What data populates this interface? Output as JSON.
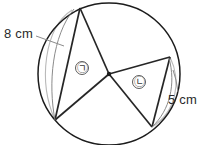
{
  "figure": {
    "kind": "circle-with-sectors",
    "title": "Circle divided by five radii with two labeled arcs",
    "circle": {
      "center_x": 109,
      "center_y": 74,
      "radius": 71,
      "stroke_color": "#1c1c1c"
    },
    "colors": {
      "outline": "#1c1c1c",
      "chord": "#262626",
      "faint_arc": "#b9b9b9",
      "leader": "#8c8c8c",
      "label_text": "#2a2a2a",
      "glyph_text": "#3a3a3a",
      "background": "#ffffff"
    },
    "center_point": {
      "label": "center",
      "x": 109,
      "y": 74
    },
    "vertices": [
      {
        "name": "top",
        "x": 80,
        "y": 8
      },
      {
        "name": "upper-left-chord-end",
        "x": 72,
        "y": 10
      },
      {
        "name": "bottom-left",
        "x": 55,
        "y": 120
      },
      {
        "name": "bottom-right",
        "x": 152,
        "y": 127
      },
      {
        "name": "right",
        "x": 170,
        "y": 57
      }
    ],
    "radii": [
      {
        "from": "center",
        "to": "top"
      },
      {
        "from": "center",
        "to": "bottom-left"
      },
      {
        "from": "center",
        "to": "bottom-right"
      },
      {
        "from": "center",
        "to": "right"
      }
    ],
    "chords": [
      {
        "name": "left-chord",
        "from": "top",
        "to": "bottom-left"
      },
      {
        "name": "right-chord",
        "from": "right",
        "to": "bottom-right"
      }
    ],
    "arc_labels": [
      {
        "id": "arc-left",
        "value": "8 cm",
        "number": 8,
        "unit": "cm",
        "side": "left",
        "text_x": 4,
        "text_y": 38
      },
      {
        "id": "arc-right",
        "value": "5 cm",
        "number": 5,
        "unit": "cm",
        "side": "right",
        "text_x": 168,
        "text_y": 104
      }
    ],
    "region_labels": [
      {
        "id": "region-ga",
        "glyph": "㉠",
        "reading": "circled-korean-kiyeok",
        "x": 82,
        "y": 68,
        "circle_radius": 6.5
      },
      {
        "id": "region-na",
        "glyph": "㉡",
        "reading": "circled-korean-nieun",
        "x": 139,
        "y": 82,
        "circle_radius": 6.5
      }
    ]
  }
}
